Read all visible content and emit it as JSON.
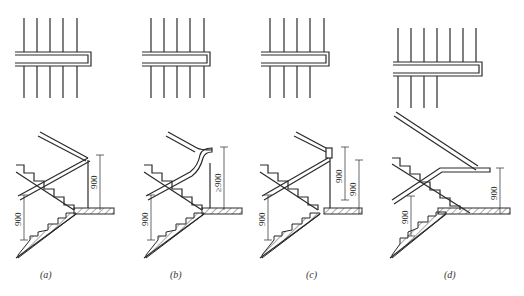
{
  "figure": {
    "panels": [
      {
        "id": "a",
        "caption": "(a)",
        "dims": [
          "900",
          "900"
        ],
        "plan_lines_top": 5,
        "plan_lines_bottom": 5
      },
      {
        "id": "b",
        "caption": "(b)",
        "dims": [
          "900",
          "≥900"
        ],
        "plan_lines_top": 5,
        "plan_lines_bottom": 5
      },
      {
        "id": "c",
        "caption": "(c)",
        "dims": [
          "900",
          "900",
          "900"
        ],
        "plan_lines_top": 5,
        "plan_lines_bottom": 4
      },
      {
        "id": "d",
        "caption": "(d)",
        "dims": [
          "900",
          "900"
        ],
        "plan_lines_top": 7,
        "plan_lines_bottom": 4
      }
    ]
  },
  "colors": {
    "ink": "#2a2a2a",
    "background": "#ffffff"
  }
}
